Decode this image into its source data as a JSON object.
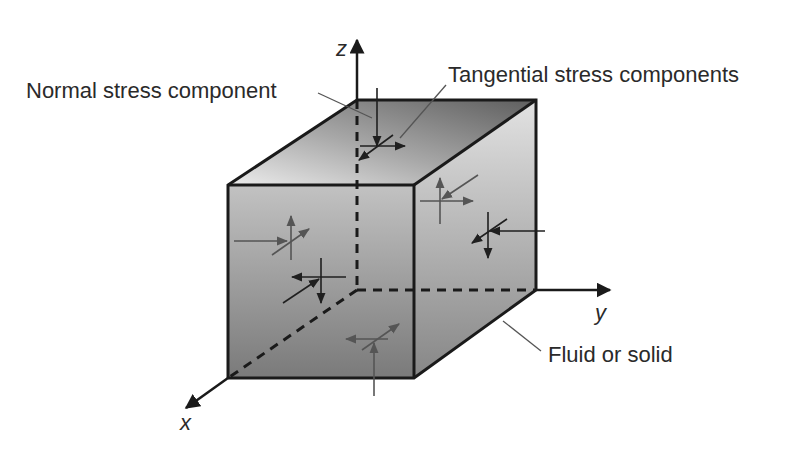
{
  "diagram": {
    "labels": {
      "normal": "Normal stress component",
      "tangential": "Tangential stress components",
      "material": "Fluid or solid"
    },
    "axes": {
      "x": "x",
      "y": "y",
      "z": "z"
    },
    "colors": {
      "edge": "#1a1a1a",
      "arrow_dark": "#1f1f1f",
      "arrow_gray": "#555555",
      "leader": "#555555",
      "front_top": "#c4c4c4",
      "front_bottom": "#7e7e7e",
      "top_light": "#e6e6e6",
      "top_dark": "#6a6a6a",
      "side_light": "#dcdcdc",
      "side_dark": "#888888"
    }
  }
}
